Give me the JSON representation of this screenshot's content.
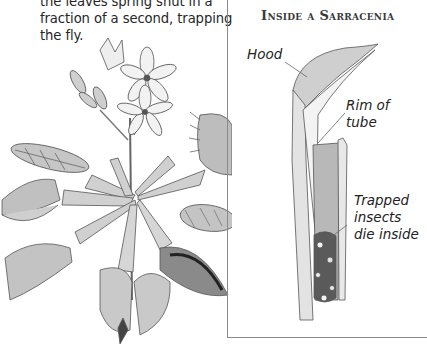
{
  "body_text": {
    "lines": [
      "the leaves spring shut in a",
      "fraction of a second, trapping",
      "the fly."
    ]
  },
  "panel": {
    "title": "Inside a Sarracenia",
    "labels": {
      "hood": "Hood",
      "rim": [
        "Rim of",
        "tube"
      ],
      "trapped": [
        "Trapped",
        "insects",
        "die inside"
      ]
    }
  },
  "illustrations": {
    "left": "venus-flytrap-plant-drawing",
    "right": "sarracenia-pitcher-cross-section-drawing"
  },
  "colors": {
    "text": "#262626",
    "border": "#8a8a8a",
    "sketch": "#555555",
    "fill_light": "#dcdcdc",
    "fill_mid": "#b5b5b5",
    "fill_dark": "#4a4a4a"
  }
}
